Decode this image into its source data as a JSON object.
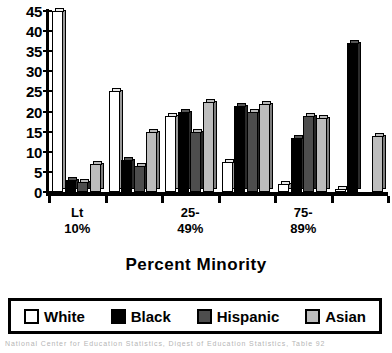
{
  "chart_data": {
    "type": "bar",
    "title": "",
    "xlabel": "Percent Minority",
    "ylabel": "",
    "ylim": [
      0,
      45
    ],
    "ytick_step": 5,
    "yticks": [
      "45",
      "40",
      "35",
      "30",
      "25",
      "20",
      "15",
      "10",
      "5",
      "0"
    ],
    "grid": false,
    "legend_position": "bottom",
    "categories": [
      "Lt\n10%",
      "",
      "25-\n49%",
      "",
      "75-\n89%",
      ""
    ],
    "category_labels": [
      {
        "line1": "Lt",
        "line2": "10%"
      },
      {
        "line1": "",
        "line2": ""
      },
      {
        "line1": "25-",
        "line2": "49%"
      },
      {
        "line1": "",
        "line2": ""
      },
      {
        "line1": "75-",
        "line2": "89%"
      },
      {
        "line1": "",
        "line2": ""
      }
    ],
    "series": [
      {
        "name": "White",
        "color": "#ffffff",
        "values": [
          45,
          25,
          19,
          7.5,
          2,
          0.8
        ]
      },
      {
        "name": "Black",
        "color": "#000000",
        "values": [
          3,
          8,
          20,
          21.5,
          13.5,
          37
        ]
      },
      {
        "name": "Hispanic",
        "color": "#4d4d4d",
        "values": [
          2.5,
          6.5,
          15,
          20,
          19,
          0
        ]
      },
      {
        "name": "Asian",
        "color": "#bdbdbd",
        "values": [
          7,
          15,
          22.5,
          22,
          18.5,
          14
        ]
      }
    ],
    "annotation": "National Center for Education Statistics, Digest of Education Statistics, Table 92"
  },
  "legend": {
    "items": [
      {
        "label": "White",
        "swatch": "legend-swatch-white"
      },
      {
        "label": "Black",
        "swatch": "legend-swatch-black"
      },
      {
        "label": "Hispanic",
        "swatch": "legend-swatch-hispanic"
      },
      {
        "label": "Asian",
        "swatch": "legend-swatch-asian"
      }
    ]
  }
}
